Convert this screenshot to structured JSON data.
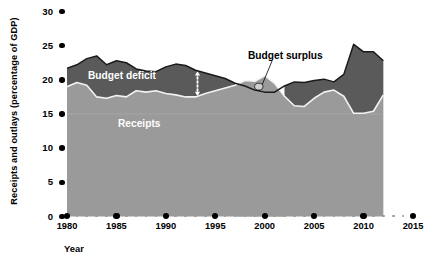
{
  "chart_data": {
    "type": "area",
    "title": "",
    "xlabel": "Year",
    "ylabel": "Receipts and outlays (percentage of GDP)",
    "xlim": [
      1979,
      2016
    ],
    "ylim": [
      0,
      30
    ],
    "ytick_values": [
      0,
      5,
      10,
      15,
      20,
      25,
      30
    ],
    "ytick_labels": [
      "0",
      "5",
      "10",
      "15",
      "20",
      "25",
      "30"
    ],
    "xtick_major_values": [
      1980,
      1985,
      1990,
      1995,
      2000,
      2005,
      2010,
      2015
    ],
    "xtick_major_labels": [
      "1980",
      "1985",
      "1990",
      "1995",
      "2000",
      "2005",
      "2010",
      "2015"
    ],
    "gridlines": [
      15
    ],
    "grid": true,
    "legend_position": "inline-annotations",
    "annotations": [
      {
        "name": "outlays-label",
        "text": "Outlays",
        "color": "#ffffff"
      },
      {
        "name": "budget-deficit-label",
        "text": "Budget deficit",
        "color": "#ffffff"
      },
      {
        "name": "receipts-label",
        "text": "Receipts",
        "color": "#ffffff"
      },
      {
        "name": "budget-surplus-label",
        "text": "Budget surplus",
        "color": "#000000"
      }
    ],
    "colors": {
      "outlays_fill": "#5a5a5a",
      "receipts_fill": "#9a9a9a",
      "receipts_line": "#f2f2f2",
      "outlays_line": "#1a1a1a",
      "gridline": "#b5b5b5",
      "background": "#ffffff",
      "tick": "#000000",
      "minor_tick": "#9a9a9a"
    },
    "x": [
      1980,
      1981,
      1982,
      1983,
      1984,
      1985,
      1986,
      1987,
      1988,
      1989,
      1990,
      1991,
      1992,
      1993,
      1994,
      1995,
      1996,
      1997,
      1998,
      1999,
      2000,
      2001,
      2002,
      2003,
      2004,
      2005,
      2006,
      2007,
      2008,
      2009,
      2010,
      2011,
      2012
    ],
    "series": [
      {
        "name": "Outlays",
        "values": [
          21.7,
          22.2,
          23.1,
          23.5,
          22.2,
          22.8,
          22.5,
          21.6,
          21.3,
          21.2,
          21.9,
          22.3,
          22.1,
          21.4,
          21.0,
          20.6,
          20.2,
          19.5,
          19.1,
          18.5,
          18.2,
          18.2,
          19.1,
          19.7,
          19.6,
          19.9,
          20.1,
          19.7,
          20.8,
          25.2,
          24.1,
          24.1,
          22.8
        ]
      },
      {
        "name": "Receipts",
        "values": [
          19.0,
          19.6,
          19.2,
          17.5,
          17.3,
          17.7,
          17.5,
          18.4,
          18.2,
          18.4,
          18.0,
          17.8,
          17.5,
          17.5,
          18.0,
          18.4,
          18.8,
          19.2,
          19.9,
          19.8,
          20.6,
          19.5,
          17.6,
          16.2,
          16.1,
          17.3,
          18.2,
          18.5,
          17.6,
          15.1,
          15.1,
          15.4,
          17.8
        ]
      }
    ],
    "regions": [
      {
        "name": "budget-deficit",
        "years": "1980-1997 and 2002-2012",
        "fill": "#5a5a5a"
      },
      {
        "name": "budget-surplus",
        "years": "1998-2001",
        "fill": "#ffffff"
      }
    ]
  }
}
